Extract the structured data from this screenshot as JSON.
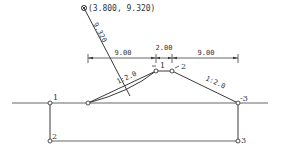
{
  "diagram": {
    "type": "embankment-cross-section",
    "circle_center_label": "(3.800, 9.320)",
    "radius_label": "9.320",
    "dimensions": {
      "left_berm": "9.00",
      "crest_width": "2.00",
      "right_berm": "9.00"
    },
    "slopes": {
      "left": "1:2.0",
      "right": "1:2.0"
    },
    "points": {
      "crest_left": "1",
      "crest_right": "2",
      "ground_left": "1",
      "ground_right": "-3",
      "bottom_left": "2",
      "bottom_right": "3"
    },
    "colors": {
      "line": "#3a3a3a",
      "text": "#333333",
      "background": "#ffffff"
    }
  }
}
